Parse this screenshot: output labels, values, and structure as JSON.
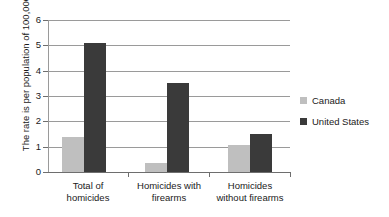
{
  "chart_data": {
    "type": "bar",
    "title": "",
    "xlabel": "",
    "ylabel": "The rate is per population of 100,000",
    "categories": [
      "Total of homicides",
      "Homicides with firearms",
      "Homicides without firearms"
    ],
    "category_lines": [
      [
        "Total of",
        "homicides"
      ],
      [
        "Homicides with",
        "firearms"
      ],
      [
        "Homicides",
        "without firearms"
      ]
    ],
    "series": [
      {
        "name": "Canada",
        "color": "#bfbfbf",
        "values": [
          1.4,
          0.35,
          1.05
        ]
      },
      {
        "name": "United States",
        "color": "#3a3a3a",
        "values": [
          5.1,
          3.5,
          1.5
        ]
      }
    ],
    "ylim": [
      0,
      6
    ],
    "yticks": [
      0,
      1,
      2,
      3,
      4,
      5,
      6
    ],
    "ytick_labels": [
      "0",
      "1",
      "2",
      "3",
      "4",
      "5",
      "6"
    ],
    "grid": true,
    "legend_position": "right"
  },
  "legend": {
    "items": [
      {
        "label": "Canada",
        "color": "#bfbfbf"
      },
      {
        "label": "United States",
        "color": "#3a3a3a"
      }
    ]
  }
}
